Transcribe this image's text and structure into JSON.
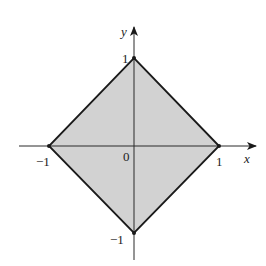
{
  "diagram": {
    "type": "coordinate-plot",
    "axes": {
      "x_label": "x",
      "y_label": "y",
      "origin_label": "0"
    },
    "ticks": {
      "x_neg": "−1",
      "x_pos": "1",
      "y_pos": "1",
      "y_neg": "−1"
    },
    "region": {
      "vertices": [
        [
          1,
          0
        ],
        [
          0,
          1
        ],
        [
          -1,
          0
        ],
        [
          0,
          -1
        ]
      ],
      "fill_color": "#d2d2d2",
      "stroke_color": "#1a1a1a"
    }
  }
}
